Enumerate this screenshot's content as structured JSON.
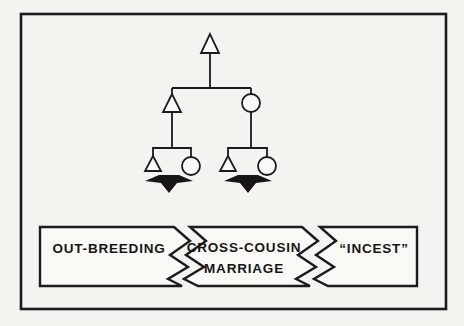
{
  "colors": {
    "paper": "#f4f3ef",
    "ink": "#1b1b1b",
    "arrow_fill": "#161616",
    "panel_fill": "#faf9f5"
  },
  "diagram": {
    "male_symbol": "triangle",
    "female_symbol": "circle",
    "arrow_symbol": "down-arrow"
  },
  "banner": {
    "segments": [
      {
        "id": "out-breeding",
        "label": "OUT-BREEDING"
      },
      {
        "id": "cross-cousin-marriage",
        "label": "CROSS-COUSIN",
        "label2": "MARRIAGE"
      },
      {
        "id": "incest",
        "label": "“INCEST”"
      }
    ]
  }
}
